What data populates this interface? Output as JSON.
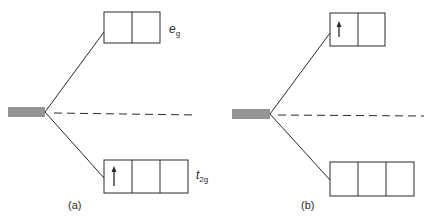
{
  "diagram": {
    "colors": {
      "line": "#2a2a2a",
      "background": "#ffffff"
    },
    "panels": [
      {
        "id": "a",
        "label": "(a)",
        "degenerate_level": {
          "lines": 5
        },
        "eg": {
          "label_main": "e",
          "label_sub": "g",
          "boxes": 2,
          "electrons": []
        },
        "t2g": {
          "label_main": "t",
          "label_sub": "2g",
          "boxes": 3,
          "electrons": [
            "up",
            "",
            ""
          ]
        }
      },
      {
        "id": "b",
        "label": "(b)",
        "degenerate_level": {
          "lines": 5
        },
        "eg": {
          "boxes": 2,
          "electrons": [
            "up",
            ""
          ]
        },
        "t2g": {
          "boxes": 3,
          "electrons": [
            "",
            "",
            ""
          ]
        }
      }
    ]
  }
}
